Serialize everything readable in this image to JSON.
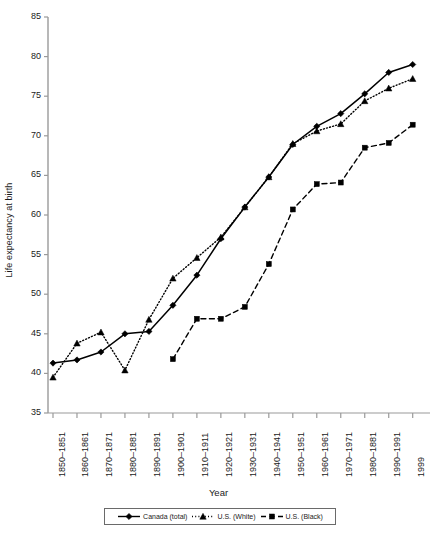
{
  "chart_data": {
    "type": "line",
    "title": "",
    "xlabel": "Year",
    "ylabel": "Life expectancy at birth",
    "ylim": [
      35,
      85
    ],
    "yticks": [
      35,
      40,
      45,
      50,
      55,
      60,
      65,
      70,
      75,
      80,
      85
    ],
    "grid": false,
    "legend_position": "bottom",
    "categories": [
      "1850–1851",
      "1860–1861",
      "1870–1871",
      "1880–1881",
      "1890–1891",
      "1900–1901",
      "1910–1911",
      "1920–1921",
      "1930–1931",
      "1940–1941",
      "1950–1951",
      "1960–1961",
      "1970–1971",
      "1980–1881",
      "1990–1991",
      "1999"
    ],
    "series": [
      {
        "name": "Canada (total)",
        "marker": "diamond",
        "line_style": "solid",
        "color": "#000000",
        "values": [
          41.3,
          41.7,
          42.7,
          45.0,
          45.3,
          48.6,
          52.4,
          57.0,
          61.0,
          64.8,
          68.9,
          71.2,
          72.8,
          75.3,
          78.0,
          79.0
        ]
      },
      {
        "name": "U.S. (White)",
        "marker": "triangle",
        "line_style": "dotted",
        "color": "#000000",
        "values": [
          39.5,
          43.8,
          45.2,
          40.4,
          46.8,
          52.0,
          54.6,
          57.2,
          61.0,
          64.8,
          69.0,
          70.6,
          71.5,
          74.4,
          76.0,
          77.2
        ]
      },
      {
        "name": "U.S. (Black)",
        "marker": "square",
        "line_style": "dashed",
        "color": "#000000",
        "values": [
          null,
          null,
          null,
          null,
          null,
          41.8,
          46.9,
          46.9,
          48.4,
          53.8,
          60.7,
          63.9,
          64.1,
          68.5,
          69.1,
          71.4
        ]
      }
    ]
  },
  "legend": {
    "entries": [
      {
        "label": "Canada (total)",
        "marker": "diamond",
        "line_style": "solid"
      },
      {
        "label": "U.S. (White)",
        "marker": "triangle",
        "line_style": "dotted"
      },
      {
        "label": "U.S. (Black)",
        "marker": "square",
        "line_style": "dashed"
      }
    ]
  }
}
